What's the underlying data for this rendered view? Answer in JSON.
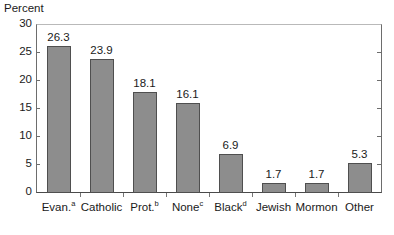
{
  "chart_data": {
    "type": "bar",
    "title": "",
    "ylabel": "Percent",
    "xlabel": "",
    "ylim": [
      0,
      30
    ],
    "yticks": [
      0,
      5,
      10,
      15,
      20,
      25,
      30
    ],
    "grid": false,
    "legend": null,
    "categories": [
      "Evan.",
      "Catholic",
      "Prot.",
      "None",
      "Black",
      "Jewish",
      "Mormon",
      "Other"
    ],
    "category_footnotes": [
      "a",
      "",
      "b",
      "c",
      "d",
      "",
      "",
      ""
    ],
    "values": [
      26.3,
      23.9,
      18.1,
      16.1,
      6.9,
      1.7,
      1.7,
      5.3
    ],
    "value_labels": [
      "26.3",
      "23.9",
      "18.1",
      "16.1",
      "6.9",
      "1.7",
      "1.7",
      "5.3"
    ],
    "bar_color": "#8d8d8d",
    "bar_edge_color": "#4f4f4f",
    "axis_color": "#4a4a4a"
  }
}
